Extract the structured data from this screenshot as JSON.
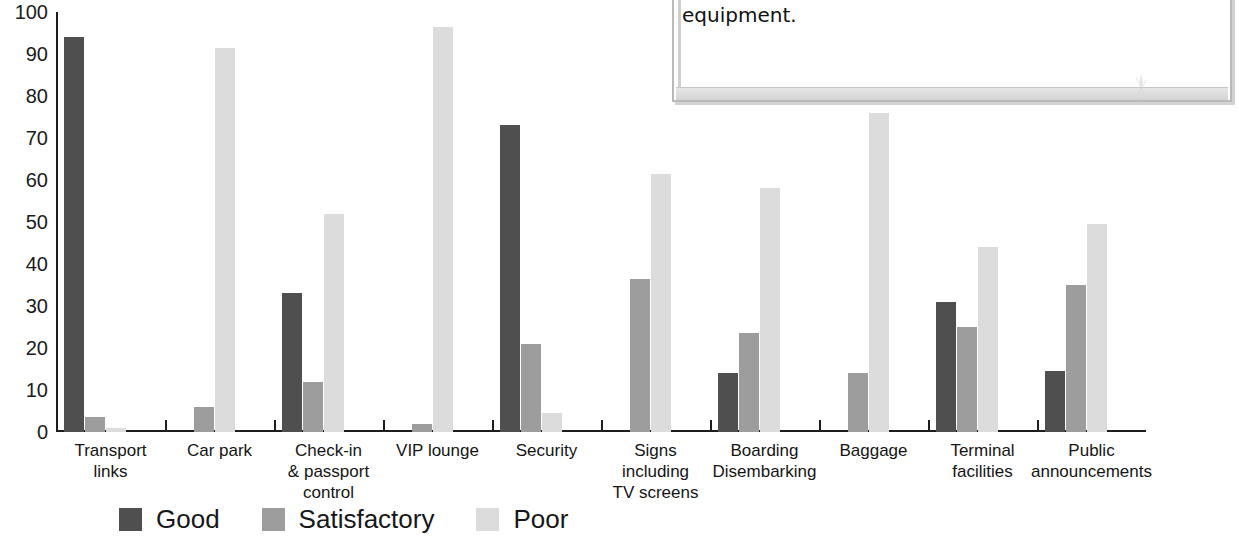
{
  "chart_data": {
    "type": "bar",
    "title": "",
    "subtitle": "",
    "xlabel": "",
    "ylabel": "",
    "ylim": [
      0,
      100
    ],
    "ytick_step": 10,
    "grid": false,
    "legend_position": "bottom-left",
    "yticks": [
      "100",
      "90",
      "80",
      "70",
      "60",
      "50",
      "40",
      "30",
      "20",
      "10",
      "0"
    ],
    "categories": [
      "Transport\nlinks",
      "Car park",
      "Check-in\n& passport\ncontrol",
      "VIP lounge",
      "Security",
      "Signs\nincluding\nTV screens",
      "Boarding\nDisembarking",
      "Baggage",
      "Terminal\nfacilities",
      "Public\nannouncements"
    ],
    "series": [
      {
        "name": "Good",
        "color": "#4f4f4f",
        "values": [
          94,
          null,
          33,
          null,
          73,
          null,
          14,
          null,
          31,
          14.5
        ]
      },
      {
        "name": "Satisfactory",
        "color": "#9d9d9d",
        "values": [
          3.5,
          6,
          12,
          2,
          21,
          36.5,
          23.5,
          14,
          25,
          35
        ]
      },
      {
        "name": "Poor",
        "color": "#dcdcdc",
        "values": [
          1,
          91.5,
          52,
          96.5,
          4.5,
          61.5,
          58,
          76,
          44,
          49.5
        ]
      }
    ]
  },
  "legend": {
    "items": [
      {
        "label": "Good",
        "swatch": "good"
      },
      {
        "label": "Satisfactory",
        "swatch": "sat"
      },
      {
        "label": "Poor",
        "swatch": "poor"
      }
    ]
  },
  "overlay": {
    "text": "improving communications than investing in expensive equipment."
  }
}
